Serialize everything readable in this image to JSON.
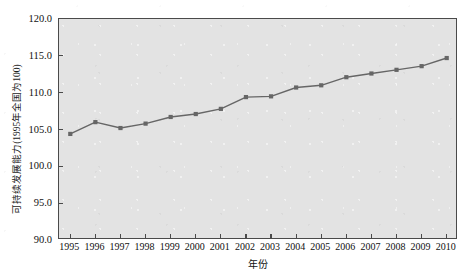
{
  "chart_data": {
    "type": "line",
    "title": "",
    "xlabel": "年份",
    "ylabel": "可持续发展能力(1995年全国为100)",
    "xlim": [
      1994.55,
      2010.45
    ],
    "ylim": [
      90.0,
      120.0
    ],
    "ytick_labels": [
      "120.0",
      "115.0",
      "110.0",
      "105.0",
      "100.0",
      "95.0",
      "90.0"
    ],
    "ytick_values": [
      120.0,
      115.0,
      110.0,
      105.0,
      100.0,
      95.0,
      90.0
    ],
    "grid": false,
    "legend": null,
    "series_color": "#666666",
    "marker": "square",
    "plot_background": "#e3e3e3",
    "categories": [
      "1995",
      "1996",
      "1997",
      "1998",
      "1999",
      "2000",
      "2001",
      "2002",
      "2003",
      "2004",
      "2005",
      "2006",
      "2007",
      "2008",
      "2009",
      "2010"
    ],
    "x": [
      1995,
      1996,
      1997,
      1998,
      1999,
      2000,
      2001,
      2002,
      2003,
      2004,
      2005,
      2006,
      2007,
      2008,
      2009,
      2010
    ],
    "values": [
      104.4,
      106.0,
      105.2,
      105.8,
      106.7,
      107.1,
      107.8,
      109.4,
      109.5,
      110.7,
      111.0,
      112.1,
      112.6,
      113.1,
      113.6,
      114.7
    ],
    "series": [
      {
        "name": "可持续发展能力",
        "values": [
          104.4,
          106.0,
          105.2,
          105.8,
          106.7,
          107.1,
          107.8,
          109.4,
          109.5,
          110.7,
          111.0,
          112.1,
          112.6,
          113.1,
          113.6,
          114.7
        ]
      }
    ]
  }
}
